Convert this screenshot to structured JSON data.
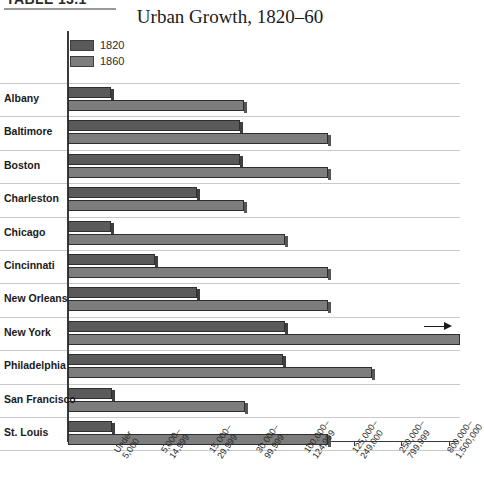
{
  "table_caption": "TABLE 13.1",
  "chart_title": "Urban Growth, 1820–60",
  "legend": {
    "position": "top-left",
    "entries": [
      {
        "label": "1820",
        "color": "#5a5a5a"
      },
      {
        "label": "1860",
        "color": "#7d7d7d"
      }
    ]
  },
  "annotations": [
    {
      "name": "new-york-overflow-arrow",
      "meaning": "New York 1860 bar extends beyond the plotted axis range"
    }
  ],
  "chart_data": {
    "type": "bar",
    "orientation": "horizontal",
    "title": "Urban Growth, 1820–60",
    "xlabel": "",
    "ylabel": "",
    "grid": true,
    "legend_position": "top-left",
    "x_axis_type": "ordinal population-size categories",
    "x_tick_labels": [
      "Under\n5,000",
      "5,000–\n14,999",
      "15,000–\n29,999",
      "30,000–\n99,999",
      "100,000–\n124,999",
      "125,000–\n249,000",
      "250,000–\n799,999",
      "800,000–\n1,500,000"
    ],
    "x_tick_index": [
      1,
      2,
      3,
      4,
      5,
      6,
      7,
      8
    ],
    "categories": [
      "Albany",
      "Baltimore",
      "Boston",
      "Charleston",
      "Chicago",
      "Cincinnati",
      "New Orleans",
      "New York",
      "Philadelphia",
      "San Francisco",
      "St. Louis"
    ],
    "series": [
      {
        "name": "1820",
        "color": "#5a5a5a",
        "values": [
          0.9,
          3.65,
          3.65,
          2.7,
          0.9,
          1.85,
          2.75,
          4.6,
          4.55,
          0.95,
          0.95
        ]
      },
      {
        "name": "1860",
        "color": "#7d7d7d",
        "values": [
          3.7,
          5.55,
          5.55,
          3.7,
          4.6,
          5.55,
          5.55,
          8.4,
          6.45,
          3.75,
          5.55
        ]
      }
    ],
    "value_units": "x-axis category index (size class reached)"
  },
  "rows": [
    {
      "label": "Albany",
      "bar1820_end": 111,
      "bar1860_end": 244,
      "overflow": false
    },
    {
      "label": "Baltimore",
      "bar1820_end": 240,
      "bar1860_end": 328,
      "overflow": false
    },
    {
      "label": "Boston",
      "bar1820_end": 240,
      "bar1860_end": 328,
      "overflow": false
    },
    {
      "label": "Charleston",
      "bar1820_end": 197,
      "bar1860_end": 244,
      "overflow": false
    },
    {
      "label": "Chicago",
      "bar1820_end": 111,
      "bar1860_end": 285,
      "overflow": false
    },
    {
      "label": "Cincinnati",
      "bar1820_end": 155,
      "bar1860_end": 328,
      "overflow": false
    },
    {
      "label": "New Orleans",
      "bar1820_end": 197,
      "bar1860_end": 328,
      "overflow": false
    },
    {
      "label": "New York",
      "bar1820_end": 285,
      "bar1860_end": 460,
      "overflow": true
    },
    {
      "label": "Philadelphia",
      "bar1820_end": 283,
      "bar1860_end": 372,
      "overflow": false
    },
    {
      "label": "San Francisco",
      "bar1820_end": 112,
      "bar1860_end": 245,
      "overflow": false
    },
    {
      "label": "St. Louis",
      "bar1820_end": 112,
      "bar1860_end": 328,
      "overflow": false
    }
  ]
}
